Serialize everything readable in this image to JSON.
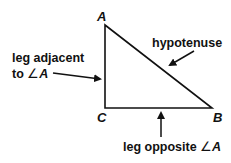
{
  "diagram": {
    "type": "right-triangle",
    "vertices": {
      "A": {
        "label": "A",
        "x": 105,
        "y": 25
      },
      "B": {
        "label": "B",
        "x": 212,
        "y": 108
      },
      "C": {
        "label": "C",
        "x": 105,
        "y": 108
      }
    },
    "labels": {
      "hypotenuse": "hypotenuse",
      "adjacent_line1": "leg adjacent",
      "adjacent_line2_prefix": "to ",
      "adjacent_angle": "∠",
      "adjacent_angle_vertex": "A",
      "opposite_prefix": "leg opposite ",
      "opposite_angle": "∠",
      "opposite_angle_vertex": "A"
    },
    "colors": {
      "stroke": "#111111",
      "text": "#111111",
      "background": "#ffffff"
    }
  }
}
